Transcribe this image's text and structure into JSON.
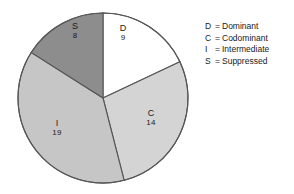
{
  "chart_data": {
    "type": "pie",
    "title": "",
    "subtitle": "",
    "xlabel": "",
    "ylabel": "",
    "total": 50,
    "start_angle_deg": 0,
    "direction": "clockwise",
    "grid": false,
    "legend_position": "right",
    "categories": [
      "D",
      "C",
      "I",
      "S"
    ],
    "values": [
      9,
      14,
      19,
      8
    ],
    "slices": [
      {
        "key": "D",
        "name": "Dominant",
        "value": 9,
        "value_label": "9",
        "percent": 18.0,
        "angle_deg": 64.8,
        "color": "#ffffff"
      },
      {
        "key": "C",
        "name": "Codominant",
        "value": 14,
        "value_label": "14",
        "percent": 28.0,
        "angle_deg": 100.8,
        "color": "#d4d4d4"
      },
      {
        "key": "I",
        "name": "Intermediate",
        "value": 19,
        "value_label": "19",
        "percent": 38.0,
        "angle_deg": 136.8,
        "color": "#c6c6c6"
      },
      {
        "key": "S",
        "name": "Suppressed",
        "value": 8,
        "value_label": "8",
        "percent": 16.0,
        "angle_deg": 57.6,
        "color": "#8d8d8d"
      }
    ],
    "outline_color": "#555555"
  },
  "legend": {
    "separator": "=",
    "entries": [
      {
        "key": "D",
        "name": "Dominant"
      },
      {
        "key": "C",
        "name": "Codominant"
      },
      {
        "key": "I",
        "name": "Intermediate"
      },
      {
        "key": "S",
        "name": "Suppressed"
      }
    ]
  }
}
